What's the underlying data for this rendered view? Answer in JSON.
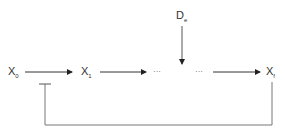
{
  "diagram": {
    "nodes": [
      {
        "id": "x0",
        "base": "X",
        "sub": "0"
      },
      {
        "id": "x1",
        "base": "X",
        "sub": "1"
      },
      {
        "id": "xf",
        "base": "X",
        "sub": "f"
      },
      {
        "id": "de",
        "base": "D",
        "sub": "e"
      }
    ],
    "ellipsis_left": "···",
    "ellipsis_right": "···",
    "edges": [
      {
        "from": "x0",
        "to": "x1",
        "type": "activation"
      },
      {
        "from": "x1",
        "to": "ellipsis_left",
        "type": "activation"
      },
      {
        "from": "de",
        "to": "chain_gap",
        "type": "activation"
      },
      {
        "from": "ellipsis_right",
        "to": "xf",
        "type": "activation"
      },
      {
        "from": "xf",
        "to": "x0_x1_edge",
        "type": "inhibition"
      }
    ],
    "colors": {
      "line": "#333333",
      "feedback_line": "#777777",
      "text": "#333333"
    }
  }
}
